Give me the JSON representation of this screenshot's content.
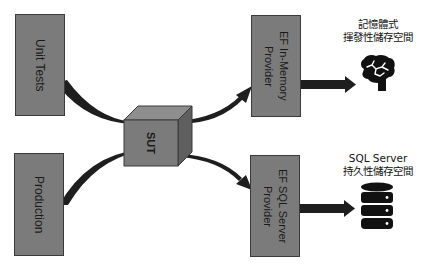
{
  "diagram": {
    "boxes": {
      "unit_tests": "Unit Tests",
      "production": "Production",
      "sut": "SUT",
      "ef_inmemory": "EF In-Memory\nProvider",
      "ef_sqlserver": "EF SQL Server\nProvider"
    },
    "labels": {
      "inmemory_storage": "記憶體式\n揮發性儲存空間",
      "sqlserver_storage": "SQL Server\n持久性儲存空間"
    },
    "icons": {
      "brain": "brain-icon",
      "database": "database-icon"
    },
    "colors": {
      "box_fill": "#7b7b7b",
      "box_border": "#3a3a3a",
      "arrow": "#1e1e1e",
      "background": "#ffffff"
    }
  }
}
